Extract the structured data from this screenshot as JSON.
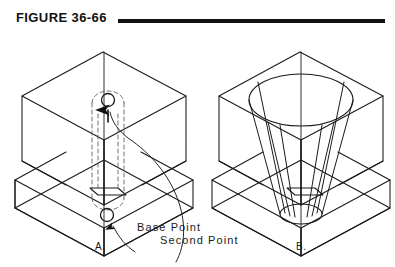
{
  "figure": {
    "title": "FIGURE 36-66",
    "rule_color": "#111111",
    "background_color": "#ffffff",
    "line_color": "#1a1a1a",
    "hidden_line_color": "#6a6a6a"
  },
  "panels": [
    {
      "id": "A",
      "caption": "A.",
      "description": "Isometric stepped block with dashed vertical extrusion channel, base point circle on lower slab and second point circle on upper block"
    },
    {
      "id": "B",
      "caption": "B.",
      "description": "Isometric stepped block with tapered conical frustum cut through the upper block down into the lower slab"
    }
  ],
  "annotations": {
    "base_point": "Base Point",
    "second_point": "Second Point"
  }
}
